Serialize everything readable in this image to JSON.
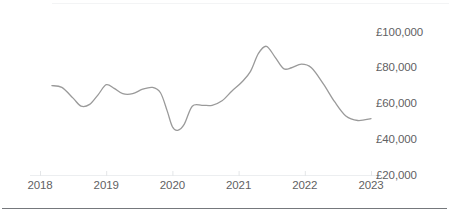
{
  "chart_data": {
    "type": "line",
    "title": "",
    "subtitle": "",
    "xlabel": "",
    "ylabel": "",
    "grid": false,
    "legend": null,
    "currency_symbol": "£",
    "xlim": [
      2018,
      2023
    ],
    "ylim": [
      20000,
      100000
    ],
    "y_ticks": [
      20000,
      40000,
      60000,
      80000,
      100000
    ],
    "y_tick_labels": [
      "£20,000",
      "£40,000",
      "£60,000",
      "£80,000",
      "£100,000"
    ],
    "x_ticks": [
      2018,
      2019,
      2020,
      2021,
      2022,
      2023
    ],
    "x_tick_labels": [
      "2018",
      "2019",
      "2020",
      "2021",
      "2022",
      "2023"
    ],
    "series": [
      {
        "name": "value",
        "color": "#9a9a9a",
        "x": [
          2018.18,
          2018.33,
          2018.5,
          2018.62,
          2018.75,
          2018.88,
          2019.0,
          2019.12,
          2019.25,
          2019.4,
          2019.55,
          2019.7,
          2019.82,
          2019.92,
          2020.0,
          2020.08,
          2020.18,
          2020.3,
          2020.45,
          2020.6,
          2020.75,
          2020.9,
          2021.05,
          2021.18,
          2021.3,
          2021.42,
          2021.55,
          2021.68,
          2021.8,
          2021.95,
          2022.1,
          2022.28,
          2022.45,
          2022.62,
          2022.8,
          2023.0
        ],
        "y": [
          70000,
          69000,
          63000,
          58500,
          59500,
          65000,
          70500,
          68500,
          65500,
          65500,
          68000,
          69000,
          66000,
          56000,
          47000,
          45000,
          48500,
          58500,
          59000,
          59000,
          61500,
          67000,
          72000,
          78000,
          88000,
          92000,
          86000,
          79500,
          80000,
          82000,
          80000,
          71000,
          61000,
          53000,
          50500,
          51500
        ]
      }
    ]
  },
  "axis": {
    "x_axis_line_color": "#eceef0",
    "tick_color": "#e4e6e8"
  }
}
